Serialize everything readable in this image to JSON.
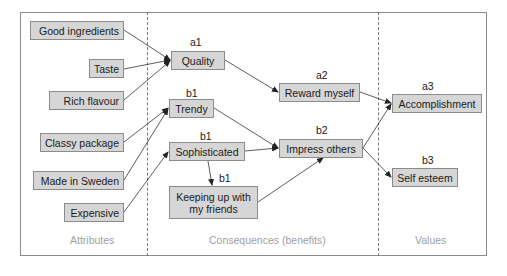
{
  "columns": [
    {
      "id": "attributes",
      "label": "Attributes"
    },
    {
      "id": "consequences",
      "label": "Consequences (benefits)"
    },
    {
      "id": "values",
      "label": "Values"
    }
  ],
  "nodes": {
    "good_ingredients": {
      "label": "Good ingredients"
    },
    "taste": {
      "label": "Taste"
    },
    "rich_flavour": {
      "label": "Rich flavour"
    },
    "classy_package": {
      "label": "Classy package"
    },
    "made_in_sweden": {
      "label": "Made in Sweden"
    },
    "expensive": {
      "label": "Expensive"
    },
    "quality": {
      "label": "Quality",
      "tag": "a1"
    },
    "trendy": {
      "label": "Trendy",
      "tag": "b1"
    },
    "sophisticated": {
      "label": "Sophisticated",
      "tag": "b1"
    },
    "keeping_up": {
      "label_line1": "Keeping up with",
      "label_line2": "my friends",
      "tag": "b1"
    },
    "reward_myself": {
      "label": "Reward myself",
      "tag": "a2"
    },
    "impress_others": {
      "label": "Impress others",
      "tag": "b2"
    },
    "accomplishment": {
      "label": "Accomplishment",
      "tag": "a3"
    },
    "self_esteem": {
      "label": "Self esteem",
      "tag": "b3"
    }
  },
  "edges": [
    [
      "Good ingredients",
      "Quality"
    ],
    [
      "Taste",
      "Quality"
    ],
    [
      "Rich flavour",
      "Quality"
    ],
    [
      "Classy package",
      "Trendy"
    ],
    [
      "Made in Sweden",
      "Trendy"
    ],
    [
      "Expensive",
      "Sophisticated"
    ],
    [
      "Quality",
      "Reward myself"
    ],
    [
      "Trendy",
      "Impress others"
    ],
    [
      "Sophisticated",
      "Impress others"
    ],
    [
      "Sophisticated",
      "Keeping up with my friends"
    ],
    [
      "Keeping up with my friends",
      "Impress others"
    ],
    [
      "Reward myself",
      "Accomplishment"
    ],
    [
      "Impress others",
      "Accomplishment"
    ],
    [
      "Impress others",
      "Self esteem"
    ]
  ]
}
